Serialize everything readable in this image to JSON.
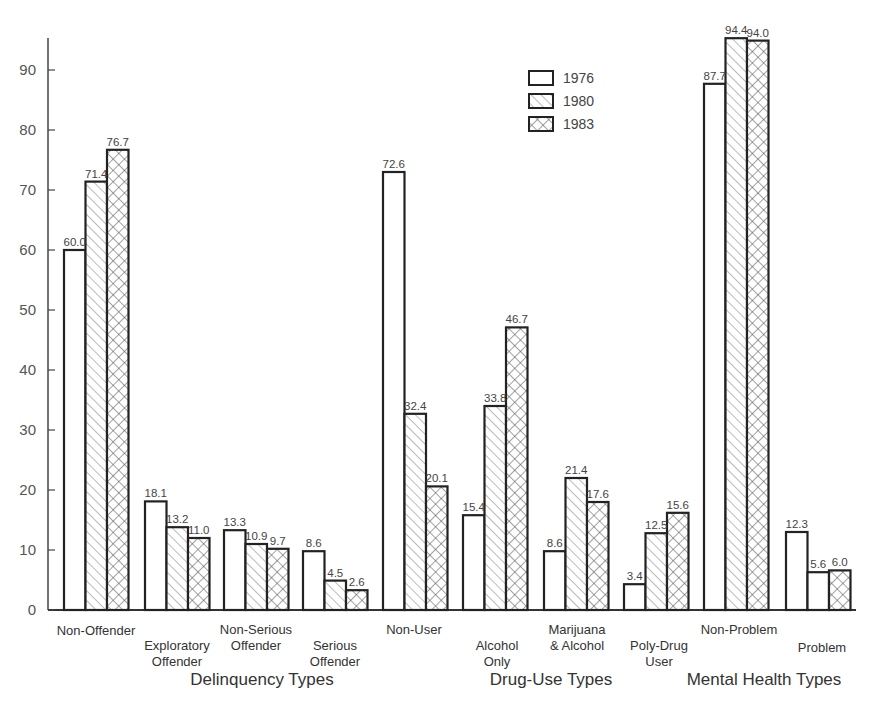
{
  "chart_data": {
    "type": "bar",
    "title": "",
    "xlabel": "",
    "ylabel": "",
    "ylim": [
      0,
      95
    ],
    "yticks": [
      0,
      10,
      20,
      30,
      40,
      50,
      60,
      70,
      80,
      90
    ],
    "grid": false,
    "legend_position": "upper center",
    "groups": [
      {
        "label": "Delinquency Types",
        "categories": [
          "Non-Offender",
          "Exploratory Offender",
          "Non-Serious Offender",
          "Serious Offender"
        ]
      },
      {
        "label": "Drug-Use Types",
        "categories": [
          "Non-User",
          "Alcohol Only",
          "Marijuana & Alcohol",
          "Poly-Drug User"
        ]
      },
      {
        "label": "Mental Health Types",
        "categories": [
          "Non-Problem",
          "Problem"
        ]
      }
    ],
    "categories": [
      "Non-Offender",
      "Exploratory Offender",
      "Non-Serious Offender",
      "Serious Offender",
      "Non-User",
      "Alcohol Only",
      "Marijuana & Alcohol",
      "Poly-Drug User",
      "Non-Problem",
      "Problem"
    ],
    "series": [
      {
        "name": "1976",
        "pattern": "plain",
        "values": [
          60.0,
          18.1,
          13.3,
          8.6,
          72.6,
          15.4,
          8.6,
          3.4,
          87.7,
          12.3
        ]
      },
      {
        "name": "1980",
        "pattern": "diagonal",
        "values": [
          71.4,
          13.2,
          10.9,
          4.5,
          32.4,
          33.8,
          21.4,
          12.5,
          94.4,
          5.6
        ]
      },
      {
        "name": "1983",
        "pattern": "crosshatch",
        "values": [
          76.7,
          11.0,
          9.7,
          2.6,
          20.1,
          46.7,
          17.6,
          15.6,
          94.0,
          6.0
        ]
      }
    ],
    "value_labels": [
      [
        "60.0",
        "18.1",
        "13.3",
        "8.6",
        "72.6",
        "15.4",
        "8.6",
        "3.4",
        "87.7",
        "12.3"
      ],
      [
        "71.4",
        "13.2",
        "10.9",
        "4.5",
        "32.4",
        "33.8",
        "21.4",
        "12.5",
        "94.4",
        "5.6"
      ],
      [
        "76.7",
        "11.0",
        "9.7",
        "2.6",
        "20.1",
        "46.7",
        "17.6",
        "15.6",
        "94.0",
        "6.0"
      ]
    ]
  },
  "layout": {
    "bar_x": [
      64,
      145,
      224,
      303,
      383,
      463,
      544,
      624,
      704,
      786
    ],
    "bar_width": 21.5,
    "bar_heights_drawn": [
      [
        60.0,
        18.1,
        13.3,
        9.8,
        73.0,
        15.8,
        9.8,
        4.3,
        87.7,
        13.0
      ],
      [
        71.4,
        13.8,
        11.0,
        4.9,
        32.7,
        34.0,
        22.0,
        12.8,
        95.3,
        6.3
      ],
      [
        76.7,
        12.0,
        10.2,
        3.3,
        20.6,
        47.1,
        18.0,
        16.2,
        94.9,
        6.6
      ]
    ],
    "category_label_lines": [
      {
        "lines": [
          "Non-Offender"
        ],
        "x": 96,
        "y": 635
      },
      {
        "lines": [
          "Exploratory",
          "Offender"
        ],
        "x": 177,
        "y": 650
      },
      {
        "lines": [
          "Non-Serious",
          "Offender"
        ],
        "x": 256,
        "y": 634
      },
      {
        "lines": [
          "Serious",
          "Offender"
        ],
        "x": 335,
        "y": 650
      },
      {
        "lines": [
          "Non-User"
        ],
        "x": 414,
        "y": 634
      },
      {
        "lines": [
          "Alcohol",
          "Only"
        ],
        "x": 497,
        "y": 650
      },
      {
        "lines": [
          "Marijuana",
          "& Alcohol"
        ],
        "x": 577,
        "y": 634
      },
      {
        "lines": [
          "Poly-Drug",
          "User"
        ],
        "x": 659,
        "y": 650
      },
      {
        "lines": [
          "Non-Problem"
        ],
        "x": 739,
        "y": 634
      },
      {
        "lines": [
          "Problem"
        ],
        "x": 822,
        "y": 652
      }
    ],
    "group_label_pos": [
      {
        "x": 262,
        "y": 685
      },
      {
        "x": 551,
        "y": 685
      },
      {
        "x": 764,
        "y": 685
      }
    ]
  }
}
